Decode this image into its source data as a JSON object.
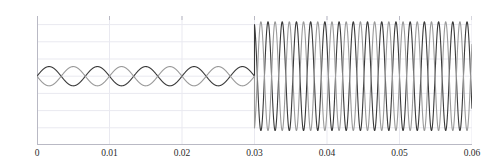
{
  "title": "",
  "chart_data": {
    "type": "line",
    "title": "",
    "subtitle": "",
    "xlabel": "",
    "ylabel": "",
    "xlim": [
      0,
      0.06
    ],
    "ylim": [
      -200,
      175
    ],
    "grid": true,
    "legend": "none",
    "x_ticks": [
      "0",
      "0.01",
      "0.02",
      "0.03",
      "0.04",
      "0.05",
      "0.06"
    ],
    "x_tick_values": [
      0,
      0.01,
      0.02,
      0.03,
      0.04,
      0.05,
      0.06
    ],
    "y_ticks": [
      "150",
      "100",
      "50",
      "0",
      "-50",
      "-100",
      "-150",
      "-200"
    ],
    "y_tick_values": [
      150,
      100,
      50,
      0,
      -50,
      -100,
      -150,
      -200
    ],
    "event_time": 0.03,
    "series": [
      {
        "name": "signal-a",
        "color": "#3a3a3a",
        "linewidth": 1.1,
        "segments": [
          {
            "phase": "pre-event",
            "t_start": 0,
            "t_end": 0.03,
            "amplitude": 28,
            "frequency_hz": 150,
            "phase_deg": 0,
            "offset": 0
          },
          {
            "phase": "post-event",
            "t_start": 0.03,
            "t_end": 0.06,
            "amplitude": 158,
            "frequency_hz": 510,
            "phase_deg": 0,
            "offset": 0
          }
        ]
      },
      {
        "name": "signal-b",
        "color": "#9a9a9a",
        "linewidth": 1.1,
        "segments": [
          {
            "phase": "pre-event",
            "t_start": 0,
            "t_end": 0.03,
            "amplitude": 28,
            "frequency_hz": 150,
            "phase_deg": 180,
            "offset": 0
          },
          {
            "phase": "post-event",
            "t_start": 0.03,
            "t_end": 0.06,
            "amplitude": 158,
            "frequency_hz": 510,
            "phase_deg": 180,
            "offset": 0
          }
        ]
      }
    ],
    "axis_color": "#b9b9c4",
    "grid_color": "#e9e9f0",
    "background": "#ffffff"
  }
}
